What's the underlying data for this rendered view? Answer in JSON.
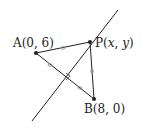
{
  "diagram": {
    "points": {
      "A": {
        "label": "A(0, 6)",
        "name": "A",
        "coords": "(0, 6)"
      },
      "B": {
        "label": "B(8, 0)",
        "name": "B",
        "coords": "(8, 0)"
      },
      "P": {
        "name": "P",
        "coords_open": "(",
        "x": "x",
        "comma": ", ",
        "y": "y",
        "coords_close": ")"
      }
    },
    "segments": [
      "AP",
      "PB",
      "AB"
    ],
    "line": "perpendicular bisector of AB through P",
    "markers": {
      "right_angle": "at midpoint of AB",
      "equal_ticks": [
        "AP",
        "PB",
        "AM",
        "MB"
      ]
    },
    "colors": {
      "stroke": "#222222",
      "tick": "#888888",
      "background": "#ffffff"
    }
  }
}
